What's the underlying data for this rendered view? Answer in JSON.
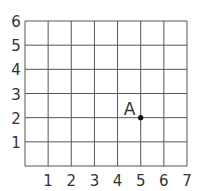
{
  "diagram": {
    "type": "coordinate-grid",
    "x_ticks": [
      "1",
      "2",
      "3",
      "4",
      "5",
      "6",
      "7"
    ],
    "y_ticks": [
      "1",
      "2",
      "3",
      "4",
      "5",
      "6"
    ],
    "columns": 7,
    "rows": 6,
    "point": {
      "label": "A",
      "x": 5,
      "y": 2
    },
    "colors": {
      "grid": "#555555",
      "text": "#333333",
      "point": "#111111"
    }
  }
}
